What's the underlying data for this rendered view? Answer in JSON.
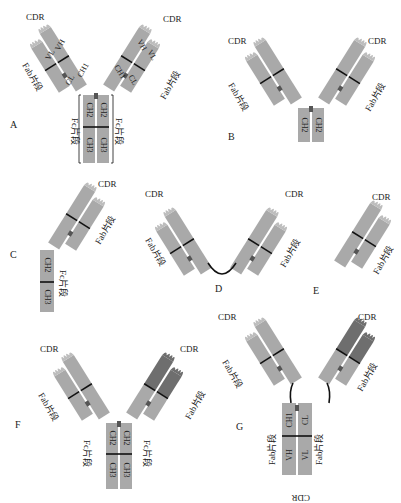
{
  "figure": {
    "panels": [
      {
        "id": "A",
        "label": "A",
        "description": "Full IgG antibody",
        "fab_label": "Fab片段",
        "fc_label": "Fc片段",
        "cdr_label": "CDR",
        "domains": [
          "VH",
          "VL",
          "CH1",
          "CL",
          "CH2",
          "CH3"
        ]
      },
      {
        "id": "B",
        "label": "B",
        "description": "F(ab')2 with CH2",
        "fab_label": "Fab片段",
        "cdr_label": "CDR",
        "domains": [
          "VH",
          "VL",
          "CH1",
          "CL",
          "CH2"
        ]
      },
      {
        "id": "C",
        "label": "C",
        "description": "Half antibody",
        "fab_label": "Fab片段",
        "fc_label": "Fc片段",
        "cdr_label": "CDR",
        "domains": [
          "VH",
          "VL",
          "CH1",
          "CL",
          "CH2",
          "CH3"
        ]
      },
      {
        "id": "D",
        "label": "D",
        "description": "F(ab')2",
        "fab_label": "Fab片段",
        "cdr_label": "CDR",
        "domains": [
          "VH",
          "VL",
          "CH1",
          "CL"
        ]
      },
      {
        "id": "E",
        "label": "E",
        "description": "Fab",
        "fab_label": "Fab片段",
        "cdr_label": "CDR",
        "domains": [
          "VH",
          "VL",
          "CH1",
          "CL"
        ]
      },
      {
        "id": "F",
        "label": "F",
        "description": "Bispecific antibody",
        "fab_label": "Fab片段",
        "fc_label": "Fc片段",
        "cdr_label": "CDR",
        "domains": [
          "VH",
          "VL",
          "CH1",
          "CL",
          "CH2",
          "CH3"
        ]
      },
      {
        "id": "G",
        "label": "G",
        "description": "Fab-Fab fusion",
        "fab_label": "Fab片段",
        "cdr_label": "CDR",
        "domains": [
          "VH",
          "VL",
          "CH1",
          "CL"
        ]
      }
    ],
    "texts": {
      "cdr": "CDR",
      "fab": "Fab片段",
      "fc": "Fc片段",
      "vh": "VH",
      "vl": "VL",
      "ch1": "CH1",
      "cl": "CL",
      "ch2": "CH2",
      "ch3": "CH3",
      "A": "A",
      "B": "B",
      "C": "C",
      "D": "D",
      "E": "E",
      "F": "F",
      "G": "G"
    },
    "colors": {
      "chain": "#a9a9a9",
      "chain_dark": "#6e6e6e",
      "line": "#111111",
      "hinge": "#555555"
    }
  }
}
